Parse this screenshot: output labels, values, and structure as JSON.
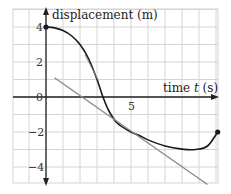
{
  "chart_data": {
    "type": "line",
    "title": "",
    "xlabel": "time t (s)",
    "ylabel": "displacement (m)",
    "x_tick_labels": [
      "5"
    ],
    "y_tick_labels": [
      "4",
      "2",
      "0",
      "−2",
      "−4"
    ],
    "xlim": [
      -1.9,
      10.1
    ],
    "ylim": [
      -4.9,
      5
    ],
    "grid": true,
    "grid_step_x": 1,
    "grid_step_y": 1,
    "series": [
      {
        "name": "displacement curve",
        "color": "#1a1a1a",
        "points": [
          [
            0,
            4
          ],
          [
            0.5,
            3.95
          ],
          [
            1,
            3.8
          ],
          [
            1.5,
            3.5
          ],
          [
            2,
            3.0
          ],
          [
            2.5,
            2.2
          ],
          [
            3,
            1.0
          ],
          [
            3.35,
            0
          ],
          [
            3.7,
            -0.8
          ],
          [
            4.2,
            -1.5
          ],
          [
            5,
            -2.0
          ],
          [
            5.5,
            -2.2
          ],
          [
            6,
            -2.45
          ],
          [
            7,
            -2.8
          ],
          [
            8,
            -2.98
          ],
          [
            8.8,
            -3.0
          ],
          [
            9.5,
            -2.8
          ],
          [
            10.1,
            -2.0
          ]
        ],
        "endpoint_markers": [
          [
            0,
            4
          ],
          [
            10.1,
            -2.0
          ]
        ]
      },
      {
        "name": "tangent line at t=5.5",
        "color": "#8a8a8a",
        "points": [
          [
            0.5,
            1.1
          ],
          [
            9.5,
            -5.0
          ]
        ]
      },
      {
        "name": "tangent near t=2.8",
        "color": "#8a8a8a",
        "points": [
          [
            2.3,
            2.4
          ],
          [
            3.1,
            0.9
          ]
        ]
      }
    ]
  },
  "labels": {
    "y_axis": "displacement (m)",
    "x_axis_prefix": "time ",
    "x_axis_var": "t",
    "x_axis_suffix": " (s)",
    "tick_x_5": "5",
    "tick_y_4": "4",
    "tick_y_2": "2",
    "tick_y_0": "0",
    "tick_y_m2": "−2",
    "tick_y_m4": "−4"
  },
  "colors": {
    "grid": "#d4d4d4",
    "axis": "#222222",
    "curve": "#1a1a1a",
    "tangent": "#8a8a8a"
  }
}
